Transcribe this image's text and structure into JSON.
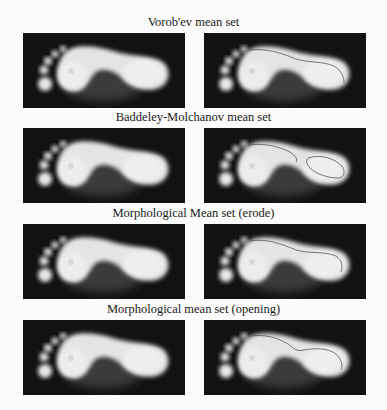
{
  "figure": {
    "rows": [
      {
        "caption": "Vorob'ev mean set",
        "contour": "single-curve"
      },
      {
        "caption": "Baddeley-Molchanov mean set",
        "contour": "two-regions"
      },
      {
        "caption": "Morphological Mean set (erode)",
        "contour": "single-curve"
      },
      {
        "caption": "Morphological mean set (opening)",
        "contour": "single-curve-wavy"
      }
    ],
    "columns": [
      "footprint-image",
      "footprint-with-mean-set-contour"
    ],
    "colors": {
      "background": "#121212",
      "foot": "#e6e6e6",
      "arch_shadow": "#3a3a3a",
      "contour": "#555555"
    }
  }
}
